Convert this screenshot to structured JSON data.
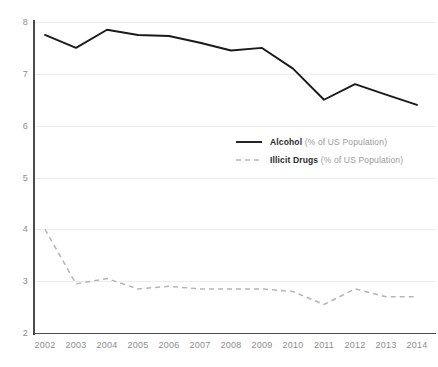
{
  "chart_data": {
    "type": "line",
    "title": "",
    "subtitle": "",
    "xlabel": "",
    "ylabel": "",
    "x": [
      2002,
      2003,
      2004,
      2005,
      2006,
      2007,
      2008,
      2009,
      2010,
      2011,
      2012,
      2013,
      2014
    ],
    "categories": [
      "2002",
      "2003",
      "2004",
      "2005",
      "2006",
      "2007",
      "2008",
      "2009",
      "2010",
      "2011",
      "2012",
      "2013",
      "2014"
    ],
    "xlim": [
      2002,
      2014
    ],
    "ylim": [
      2,
      8
    ],
    "yticks": [
      2,
      3,
      4,
      5,
      6,
      7,
      8
    ],
    "ytick_labels": [
      "2",
      "3",
      "4",
      "5",
      "6",
      "7",
      "8"
    ],
    "grid": "horizontal",
    "legend_position": "center-right",
    "series": [
      {
        "name": "Alcohol",
        "unit": "(% of US Population)",
        "legend_label": "Alcohol (% of US Population)",
        "style": "solid",
        "color": "#1a1a1a",
        "values": [
          7.75,
          7.5,
          7.85,
          7.75,
          7.73,
          7.6,
          7.45,
          7.5,
          7.1,
          6.5,
          6.8,
          6.6,
          6.4
        ]
      },
      {
        "name": "Illicit Drugs",
        "unit": "(% of US Population)",
        "legend_label": "Illicit Drugs (% of US Population)",
        "style": "dashed",
        "color": "#b5b5b5",
        "values": [
          4.0,
          2.95,
          3.05,
          2.85,
          2.9,
          2.85,
          2.85,
          2.85,
          2.8,
          2.55,
          2.85,
          2.7,
          2.7
        ]
      }
    ]
  },
  "axis": {
    "spine_color": "#4a4a4a",
    "grid_color": "#ececec",
    "tick_label_color": "#8d8d8d"
  }
}
